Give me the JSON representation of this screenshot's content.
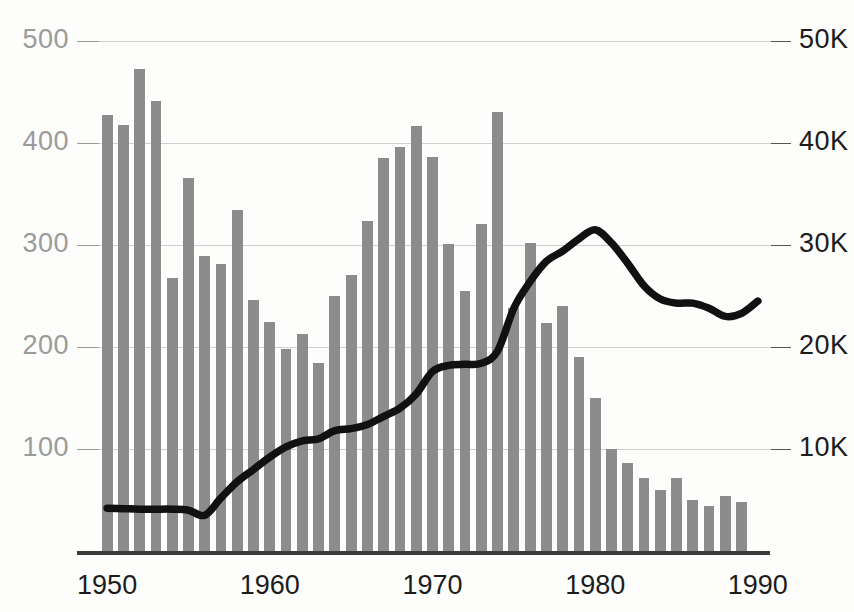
{
  "chart_data": {
    "type": "bar",
    "title": "",
    "subtitle": "",
    "xlabel": "",
    "ylabel": "",
    "grid": true,
    "legend": "none",
    "x": [
      1950,
      1951,
      1952,
      1953,
      1954,
      1955,
      1956,
      1957,
      1958,
      1959,
      1960,
      1961,
      1962,
      1963,
      1964,
      1965,
      1966,
      1967,
      1968,
      1969,
      1970,
      1971,
      1972,
      1973,
      1974,
      1975,
      1976,
      1977,
      1978,
      1979,
      1980,
      1981,
      1982,
      1983,
      1984,
      1985,
      1986,
      1987,
      1988,
      1989,
      1990
    ],
    "x_tick_labels": [
      "1950",
      "1960",
      "1970",
      "1980",
      "1990"
    ],
    "x_tick_values": [
      1950,
      1960,
      1970,
      1980,
      1990
    ],
    "xlim": [
      1949.5,
      1990.5
    ],
    "left_axis": {
      "label": "",
      "tick_labels": [
        "100",
        "200",
        "300",
        "400",
        "500"
      ],
      "tick_values": [
        100,
        200,
        300,
        400,
        500
      ],
      "ylim": [
        0,
        500
      ],
      "color": "#9b9b9b"
    },
    "right_axis": {
      "label": "",
      "tick_labels": [
        "10K",
        "20K",
        "30K",
        "40K",
        "50K"
      ],
      "tick_values": [
        10000,
        20000,
        30000,
        40000,
        50000
      ],
      "ylim": [
        0,
        50000
      ],
      "color": "#1c1c1c"
    },
    "series": [
      {
        "name": "bars",
        "type": "bar",
        "axis": "left",
        "color": "#8c8c8c",
        "values": [
          427,
          418,
          473,
          441,
          268,
          366,
          289,
          281,
          334,
          246,
          225,
          198,
          213,
          184,
          250,
          271,
          324,
          385,
          396,
          417,
          386,
          301,
          255,
          321,
          430,
          238,
          302,
          224,
          240,
          190,
          150,
          100,
          86,
          72,
          60,
          72,
          50,
          44,
          54,
          48,
          0
        ]
      },
      {
        "name": "line",
        "type": "line",
        "axis": "right",
        "color": "#111111",
        "values": [
          4200,
          4150,
          4100,
          4100,
          4100,
          4000,
          3500,
          5200,
          6800,
          8000,
          9200,
          10200,
          10800,
          11000,
          11800,
          12000,
          12400,
          13200,
          14000,
          15400,
          17600,
          18200,
          18300,
          18400,
          19600,
          23800,
          26400,
          28400,
          29400,
          30600,
          31500,
          30200,
          28200,
          26000,
          24700,
          24300,
          24300,
          23800,
          23000,
          23300,
          24500
        ]
      }
    ]
  },
  "axes": {
    "left_ticks": [
      {
        "label": "500",
        "value": 500
      },
      {
        "label": "400",
        "value": 400
      },
      {
        "label": "300",
        "value": 300
      },
      {
        "label": "200",
        "value": 200
      },
      {
        "label": "100",
        "value": 100
      }
    ],
    "right_ticks": [
      {
        "label": "50K",
        "value": 50000
      },
      {
        "label": "40K",
        "value": 40000
      },
      {
        "label": "30K",
        "value": 30000
      },
      {
        "label": "20K",
        "value": 20000
      },
      {
        "label": "10K",
        "value": 10000
      }
    ],
    "x_ticks": [
      {
        "label": "1950",
        "value": 1950
      },
      {
        "label": "1960",
        "value": 1960
      },
      {
        "label": "1970",
        "value": 1970
      },
      {
        "label": "1980",
        "value": 1980
      },
      {
        "label": "1990",
        "value": 1990
      }
    ]
  },
  "colors": {
    "bar": "#8c8c8c",
    "line": "#111111",
    "grid": "#cfcfcf",
    "left_axis_text": "#9b9b9b",
    "right_axis_text": "#1c1c1c",
    "baseline": "#3c3c3c",
    "background": "#fdfdfc"
  }
}
